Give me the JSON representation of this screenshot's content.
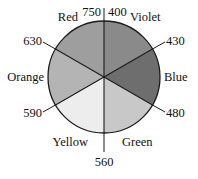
{
  "figure": {
    "background_color": "#ffffff",
    "outline_color": "#1a1a1a",
    "text_color": "#111111"
  },
  "chart_data": {
    "type": "pie",
    "title": "",
    "xlabel": "",
    "ylabel": "",
    "legend_position": "none",
    "grid": false,
    "note": "Six equal 60-degree sectors of a circle; each sector is a named color band of the visible spectrum, and the boundary radii are annotated with wavelengths in nanometers. The wheel is drawn in grayscale.",
    "center": {
      "x": 104,
      "y": 77
    },
    "radius": 56,
    "categories": [
      "Violet",
      "Blue",
      "Green",
      "Yellow",
      "Orange",
      "Red"
    ],
    "values": [
      60,
      60,
      60,
      60,
      60,
      60
    ],
    "units": "degrees",
    "slices": [
      {
        "label": "Violet",
        "value": 60,
        "start_angle_deg": 0,
        "end_angle_deg": 60,
        "fill": "#8a8a8a",
        "wavelength_range_nm": [
          400,
          430
        ]
      },
      {
        "label": "Blue",
        "value": 60,
        "start_angle_deg": 60,
        "end_angle_deg": 120,
        "fill": "#6e6e6e",
        "wavelength_range_nm": [
          430,
          480
        ]
      },
      {
        "label": "Green",
        "value": 60,
        "start_angle_deg": 120,
        "end_angle_deg": 180,
        "fill": "#c8c8c8",
        "wavelength_range_nm": [
          480,
          560
        ]
      },
      {
        "label": "Yellow",
        "value": 60,
        "start_angle_deg": 180,
        "end_angle_deg": 240,
        "fill": "#ededed",
        "wavelength_range_nm": [
          560,
          590
        ]
      },
      {
        "label": "Orange",
        "value": 60,
        "start_angle_deg": 240,
        "end_angle_deg": 300,
        "fill": "#b4b4b4",
        "wavelength_range_nm": [
          590,
          630
        ]
      },
      {
        "label": "Red",
        "value": 60,
        "start_angle_deg": 300,
        "end_angle_deg": 360,
        "fill": "#9e9e9e",
        "wavelength_range_nm": [
          630,
          750
        ]
      }
    ],
    "boundary_annotations": [
      {
        "label": "750",
        "angle_deg": 0,
        "unit": "nm",
        "position": "top-left-of-vertical"
      },
      {
        "label": "400",
        "angle_deg": 0,
        "unit": "nm",
        "position": "top-right-of-vertical"
      },
      {
        "label": "430",
        "angle_deg": 60,
        "unit": "nm",
        "position": "upper-right"
      },
      {
        "label": "480",
        "angle_deg": 120,
        "unit": "nm",
        "position": "lower-right"
      },
      {
        "label": "560",
        "angle_deg": 180,
        "unit": "nm",
        "position": "bottom"
      },
      {
        "label": "590",
        "angle_deg": 240,
        "unit": "nm",
        "position": "lower-left"
      },
      {
        "label": "630",
        "angle_deg": 300,
        "unit": "nm",
        "position": "upper-left"
      }
    ]
  },
  "labels": {
    "colors": {
      "violet": "Violet",
      "blue": "Blue",
      "green": "Green",
      "yellow": "Yellow",
      "orange": "Orange",
      "red": "Red"
    },
    "wavelengths": {
      "w750": "750",
      "w400": "400",
      "w430": "430",
      "w480": "480",
      "w560": "560",
      "w590": "590",
      "w630": "630"
    }
  }
}
